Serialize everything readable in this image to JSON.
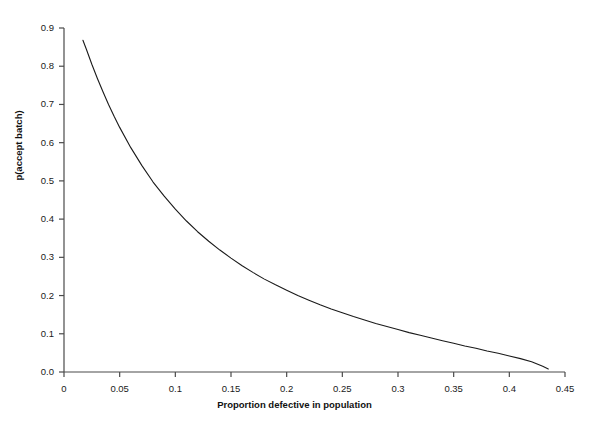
{
  "chart_data": {
    "type": "line",
    "title": "",
    "xlabel": "Proportion defective in population",
    "ylabel": "p(accept batch)",
    "xlim": [
      0,
      0.45
    ],
    "ylim": [
      0.0,
      0.9
    ],
    "grid": false,
    "legend": null,
    "x_ticks": [
      "0",
      "0.05",
      "0.1",
      "0.15",
      "0.2",
      "0.25",
      "0.3",
      "0.35",
      "0.4",
      "0.45"
    ],
    "x_tick_values": [
      0,
      0.05,
      0.1,
      0.15,
      0.2,
      0.25,
      0.3,
      0.35,
      0.4,
      0.45
    ],
    "y_ticks": [
      "0.0",
      "0.1",
      "0.2",
      "0.3",
      "0.4",
      "0.5",
      "0.6",
      "0.7",
      "0.8",
      "0.9"
    ],
    "y_tick_values": [
      0.0,
      0.1,
      0.2,
      0.3,
      0.4,
      0.5,
      0.6,
      0.7,
      0.8,
      0.9
    ],
    "series": [
      {
        "name": "operating characteristic curve",
        "color": "#1a1a1a",
        "x": [
          0.017,
          0.02,
          0.025,
          0.03,
          0.035,
          0.04,
          0.045,
          0.05,
          0.06,
          0.07,
          0.08,
          0.09,
          0.1,
          0.11,
          0.12,
          0.13,
          0.14,
          0.15,
          0.16,
          0.17,
          0.18,
          0.19,
          0.2,
          0.21,
          0.22,
          0.23,
          0.24,
          0.25,
          0.26,
          0.27,
          0.28,
          0.29,
          0.3,
          0.31,
          0.32,
          0.33,
          0.34,
          0.35,
          0.36,
          0.37,
          0.38,
          0.39,
          0.4,
          0.41,
          0.42,
          0.43,
          0.435
        ],
        "y": [
          0.868,
          0.845,
          0.805,
          0.768,
          0.733,
          0.7,
          0.669,
          0.64,
          0.587,
          0.54,
          0.497,
          0.46,
          0.426,
          0.395,
          0.367,
          0.342,
          0.319,
          0.298,
          0.278,
          0.26,
          0.243,
          0.228,
          0.214,
          0.2,
          0.188,
          0.176,
          0.165,
          0.155,
          0.145,
          0.136,
          0.127,
          0.119,
          0.111,
          0.103,
          0.096,
          0.089,
          0.082,
          0.075,
          0.068,
          0.062,
          0.055,
          0.049,
          0.042,
          0.035,
          0.027,
          0.015,
          0.008
        ]
      }
    ]
  },
  "axis_geometry": {
    "plot_left_px": 64,
    "plot_right_px": 565,
    "plot_top_px": 28,
    "plot_bottom_px": 372,
    "axis_color": "#4a4a4a",
    "curve_color": "#1a1a1a"
  }
}
